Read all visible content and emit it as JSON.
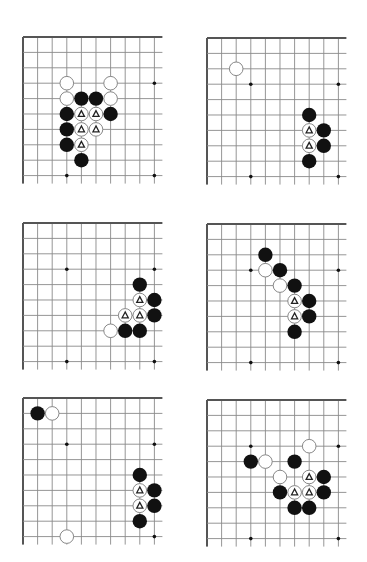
{
  "page": {
    "colors": {
      "background": "#ffffff",
      "edge_line": "#555555",
      "grid_line": "#8a8a8a",
      "black_stone": "#111111",
      "white_stone_fill": "#ffffff",
      "white_stone_stroke": "#7a7a7a",
      "hoshi": "#111111",
      "marker": "#222222"
    },
    "grid": {
      "cols": 10,
      "rows": 10,
      "col_spacing": 14.6,
      "row_spacing": 15.4,
      "overhang": 8,
      "stone_radius": 7.2
    }
  },
  "diagrams": [
    {
      "id": "diagram-1",
      "origin": [
        23,
        37
      ],
      "hoshi": [
        [
          3,
          3
        ],
        [
          9,
          3
        ],
        [
          3,
          9
        ],
        [
          9,
          9
        ]
      ],
      "stones": [
        {
          "c": 3,
          "r": 3,
          "color": "white"
        },
        {
          "c": 6,
          "r": 3,
          "color": "white"
        },
        {
          "c": 3,
          "r": 4,
          "color": "white"
        },
        {
          "c": 4,
          "r": 4,
          "color": "black"
        },
        {
          "c": 5,
          "r": 4,
          "color": "black"
        },
        {
          "c": 6,
          "r": 4,
          "color": "white"
        },
        {
          "c": 3,
          "r": 5,
          "color": "black"
        },
        {
          "c": 4,
          "r": 5,
          "color": "white",
          "mark": "triangle"
        },
        {
          "c": 5,
          "r": 5,
          "color": "white",
          "mark": "triangle"
        },
        {
          "c": 6,
          "r": 5,
          "color": "black"
        },
        {
          "c": 3,
          "r": 6,
          "color": "black"
        },
        {
          "c": 4,
          "r": 6,
          "color": "white",
          "mark": "triangle"
        },
        {
          "c": 5,
          "r": 6,
          "color": "white",
          "mark": "triangle"
        },
        {
          "c": 3,
          "r": 7,
          "color": "black"
        },
        {
          "c": 4,
          "r": 7,
          "color": "white",
          "mark": "triangle"
        },
        {
          "c": 4,
          "r": 8,
          "color": "black"
        }
      ]
    },
    {
      "id": "diagram-2",
      "origin": [
        207,
        38
      ],
      "hoshi": [
        [
          3,
          3
        ],
        [
          9,
          3
        ],
        [
          3,
          9
        ],
        [
          9,
          9
        ]
      ],
      "stones": [
        {
          "c": 2,
          "r": 2,
          "color": "white"
        },
        {
          "c": 7,
          "r": 5,
          "color": "black"
        },
        {
          "c": 7,
          "r": 6,
          "color": "white",
          "mark": "triangle"
        },
        {
          "c": 8,
          "r": 6,
          "color": "black"
        },
        {
          "c": 7,
          "r": 7,
          "color": "white",
          "mark": "triangle"
        },
        {
          "c": 8,
          "r": 7,
          "color": "black"
        },
        {
          "c": 7,
          "r": 8,
          "color": "black"
        }
      ]
    },
    {
      "id": "diagram-3",
      "origin": [
        23,
        223
      ],
      "hoshi": [
        [
          3,
          3
        ],
        [
          9,
          3
        ],
        [
          3,
          9
        ],
        [
          9,
          9
        ]
      ],
      "stones": [
        {
          "c": 8,
          "r": 4,
          "color": "black"
        },
        {
          "c": 8,
          "r": 5,
          "color": "white",
          "mark": "triangle"
        },
        {
          "c": 9,
          "r": 5,
          "color": "black"
        },
        {
          "c": 7,
          "r": 6,
          "color": "white",
          "mark": "triangle"
        },
        {
          "c": 8,
          "r": 6,
          "color": "white",
          "mark": "triangle"
        },
        {
          "c": 9,
          "r": 6,
          "color": "black"
        },
        {
          "c": 6,
          "r": 7,
          "color": "white"
        },
        {
          "c": 7,
          "r": 7,
          "color": "black"
        },
        {
          "c": 8,
          "r": 7,
          "color": "black"
        }
      ]
    },
    {
      "id": "diagram-4",
      "origin": [
        207,
        224
      ],
      "hoshi": [
        [
          3,
          3
        ],
        [
          9,
          3
        ],
        [
          3,
          9
        ],
        [
          9,
          9
        ]
      ],
      "stones": [
        {
          "c": 4,
          "r": 2,
          "color": "black"
        },
        {
          "c": 4,
          "r": 3,
          "color": "white"
        },
        {
          "c": 5,
          "r": 3,
          "color": "black"
        },
        {
          "c": 5,
          "r": 4,
          "color": "white"
        },
        {
          "c": 6,
          "r": 4,
          "color": "black"
        },
        {
          "c": 6,
          "r": 5,
          "color": "white",
          "mark": "triangle"
        },
        {
          "c": 7,
          "r": 5,
          "color": "black"
        },
        {
          "c": 6,
          "r": 6,
          "color": "white",
          "mark": "triangle"
        },
        {
          "c": 7,
          "r": 6,
          "color": "black"
        },
        {
          "c": 6,
          "r": 7,
          "color": "black"
        }
      ]
    },
    {
      "id": "diagram-5",
      "origin": [
        23,
        398
      ],
      "hoshi": [
        [
          3,
          3
        ],
        [
          9,
          3
        ],
        [
          9,
          9
        ]
      ],
      "stones": [
        {
          "c": 1,
          "r": 1,
          "color": "black"
        },
        {
          "c": 2,
          "r": 1,
          "color": "white"
        },
        {
          "c": 8,
          "r": 5,
          "color": "black"
        },
        {
          "c": 8,
          "r": 6,
          "color": "white",
          "mark": "triangle"
        },
        {
          "c": 9,
          "r": 6,
          "color": "black"
        },
        {
          "c": 8,
          "r": 7,
          "color": "white",
          "mark": "triangle"
        },
        {
          "c": 9,
          "r": 7,
          "color": "black"
        },
        {
          "c": 8,
          "r": 8,
          "color": "black"
        },
        {
          "c": 3,
          "r": 9,
          "color": "white"
        }
      ]
    },
    {
      "id": "diagram-6",
      "origin": [
        207,
        400
      ],
      "hoshi": [
        [
          3,
          3
        ],
        [
          9,
          3
        ],
        [
          3,
          9
        ],
        [
          9,
          9
        ]
      ],
      "stones": [
        {
          "c": 7,
          "r": 3,
          "color": "white"
        },
        {
          "c": 3,
          "r": 4,
          "color": "black"
        },
        {
          "c": 4,
          "r": 4,
          "color": "white"
        },
        {
          "c": 6,
          "r": 4,
          "color": "black"
        },
        {
          "c": 5,
          "r": 5,
          "color": "white"
        },
        {
          "c": 7,
          "r": 5,
          "color": "white",
          "mark": "triangle"
        },
        {
          "c": 8,
          "r": 5,
          "color": "black"
        },
        {
          "c": 5,
          "r": 6,
          "color": "black"
        },
        {
          "c": 6,
          "r": 6,
          "color": "white",
          "mark": "triangle"
        },
        {
          "c": 7,
          "r": 6,
          "color": "white",
          "mark": "triangle"
        },
        {
          "c": 8,
          "r": 6,
          "color": "black"
        },
        {
          "c": 6,
          "r": 7,
          "color": "black"
        },
        {
          "c": 7,
          "r": 7,
          "color": "black"
        }
      ]
    }
  ]
}
